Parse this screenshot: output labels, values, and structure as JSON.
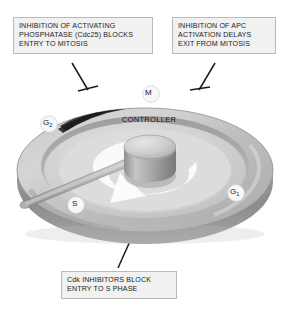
{
  "figure": {
    "background_color": "#ffffff"
  },
  "callouts": [
    {
      "id": "top-left",
      "lines": [
        "INHIBITION OF ACTIVATING",
        "PHOSPHATASE (Cdc25) BLOCKS",
        "ENTRY TO MITOSIS"
      ],
      "fill_color": "#f1f1f1",
      "border_color": "#b9b9b9",
      "text_color": "#1b1b1b"
    },
    {
      "id": "top-right",
      "lines": [
        "INHIBITION OF APC",
        "ACTIVATION DELAYS",
        "EXIT FROM MITOSIS"
      ],
      "fill_color": "#f1f1f1",
      "border_color": "#b9b9b9",
      "text_color": "#1b1b1b"
    },
    {
      "id": "bottom",
      "lines": [
        "Cdk INHIBITORS BLOCK",
        "ENTRY TO S PHASE"
      ],
      "fill_color": "#f1f1f1",
      "border_color": "#b9b9b9",
      "text_color": "#1b1b1b"
    }
  ],
  "dial": {
    "hub_label": "CONTROLLER",
    "phases": [
      {
        "id": "m",
        "label": "M",
        "subscript": ""
      },
      {
        "id": "g2",
        "label": "G",
        "subscript": "2"
      },
      {
        "id": "s",
        "label": "S",
        "subscript": ""
      },
      {
        "id": "g1",
        "label": "G",
        "subscript": "1"
      }
    ],
    "rotation_arrow": "counterclockwise-white-arrow",
    "pointer_arm": "radial-pointer-to-S-phase",
    "gap_notch": "dark-notch-between-G2-and-M",
    "colors": {
      "rim_top_light": "#cdcdcd",
      "rim_top_mid": "#b5b5b5",
      "rim_side_dark": "#8e8e8e",
      "disc_face": "#c4c4c4",
      "inner_face": "#d6d6d6",
      "hub_light": "#dcdcdc",
      "hub_dark": "#9a9a9a",
      "arrow_white": "#fbfbfb",
      "badge_white": "#f6f6f6",
      "leader_line": "#1a1a1a"
    }
  }
}
